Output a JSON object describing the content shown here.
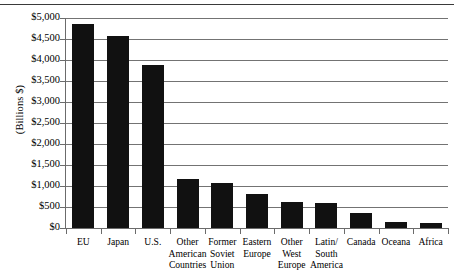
{
  "chart_data": {
    "type": "bar",
    "title": "",
    "xlabel": "",
    "ylabel": "(Billions $)",
    "ylim": [
      0,
      5000
    ],
    "ytick_step": 500,
    "grid": true,
    "legend": "none",
    "bar_color": "#111111",
    "grid_color": "#737373",
    "axis_color": "#6b6b6b",
    "categories": [
      "EU",
      "Japan",
      "U.S.",
      "Other American Countries",
      "Former Soviet Union",
      "Eastern Europe",
      "Other West Europe",
      "Latin/ South America",
      "Canada",
      "Oceana",
      "Africa"
    ],
    "category_lines": [
      "EU",
      "Japan",
      "U.S.",
      "Other\nAmerican\nCountries",
      "Former\nSoviet\nUnion",
      "Eastern\nEurope",
      "Other\nWest\nEurope",
      "Latin/\nSouth\nAmerica",
      "Canada",
      "Oceana",
      "Africa"
    ],
    "values": [
      4860,
      4580,
      3880,
      1160,
      1060,
      800,
      620,
      600,
      350,
      135,
      130
    ],
    "ytick_labels": [
      "$5,000",
      "$4,500",
      "$4,000",
      "$3,500",
      "$3,000",
      "$2,500",
      "$2,000",
      "$1,500",
      "$1,000",
      "$500",
      "$0"
    ],
    "ytick_values": [
      5000,
      4500,
      4000,
      3500,
      3000,
      2500,
      2000,
      1500,
      1000,
      500,
      0
    ]
  }
}
